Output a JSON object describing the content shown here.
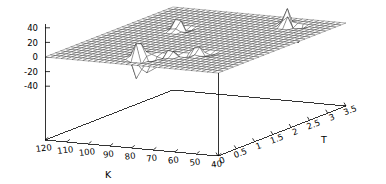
{
  "chart_data": {
    "type": "surface",
    "title": "",
    "xlabel": "K",
    "ylabel": "T",
    "zlabel": "",
    "grid": true,
    "legend": false,
    "projection": "3d-wireframe",
    "background": "#ffffff",
    "line_color": "#000000",
    "axes": {
      "x": {
        "name": "K",
        "ticks": [
          120,
          110,
          100,
          90,
          80,
          70,
          60,
          50,
          40
        ],
        "tick_labels": [
          "120",
          "110",
          "100",
          "90",
          "80",
          "70",
          "60",
          "50",
          "40"
        ],
        "range": [
          120,
          40
        ],
        "direction": "descending-left-to-right"
      },
      "y": {
        "name": "T",
        "ticks": [
          0,
          0.5,
          1,
          1.5,
          2,
          2.5,
          3,
          3.5
        ],
        "tick_labels": [
          "0",
          "0.5",
          "1",
          "1.5",
          "2",
          "2.5",
          "3",
          "3.5"
        ],
        "range": [
          0,
          3.5
        ],
        "direction": "ascending-left-to-right"
      },
      "z": {
        "name": "",
        "ticks": [
          40,
          20,
          0,
          -20,
          -40
        ],
        "tick_labels": [
          "40",
          "20",
          "0",
          "-20",
          "-40"
        ],
        "range": [
          -50,
          50
        ]
      }
    },
    "surface": {
      "description": "Near-flat zero surface over the K-T plane with localized spikes",
      "baseline": 0,
      "nx": 33,
      "ny": 26,
      "spikes": [
        {
          "k": 82,
          "t": 0.35,
          "z": -62,
          "label": "large-negative-spike"
        },
        {
          "k": 84,
          "t": 0.45,
          "z": 34,
          "label": "positive-spike-a"
        },
        {
          "k": 80,
          "t": 0.5,
          "z": -26,
          "label": "negative-spike-b"
        },
        {
          "k": 86,
          "t": 0.6,
          "z": 22,
          "label": "positive-spike-c"
        },
        {
          "k": 78,
          "t": 0.62,
          "z": -18,
          "label": "negative-spike-d"
        },
        {
          "k": 74,
          "t": 0.75,
          "z": 16,
          "label": "ripple-a"
        },
        {
          "k": 70,
          "t": 0.85,
          "z": -12,
          "label": "ripple-b"
        },
        {
          "k": 66,
          "t": 0.95,
          "z": 14,
          "label": "ripple-c"
        },
        {
          "k": 62,
          "t": 1.05,
          "z": -9,
          "label": "ripple-d"
        },
        {
          "k": 96,
          "t": 2.2,
          "z": 30,
          "label": "positive-spike-mid"
        },
        {
          "k": 94,
          "t": 2.3,
          "z": -14,
          "label": "negative-spike-mid"
        },
        {
          "k": 58,
          "t": 3.0,
          "z": 34,
          "label": "positive-spike-right"
        },
        {
          "k": 56,
          "t": 3.05,
          "z": -36,
          "label": "negative-spike-right"
        },
        {
          "k": 60,
          "t": 3.1,
          "z": 20,
          "label": "positive-spike-right-b"
        }
      ]
    }
  },
  "labels": {
    "x_axis_name": "K",
    "y_axis_name": "T",
    "z_ticks": [
      "40",
      "20",
      "0",
      "-20",
      "-40"
    ],
    "x_ticks": [
      "120",
      "110",
      "100",
      "90",
      "80",
      "70",
      "60",
      "50",
      "40"
    ],
    "y_ticks": [
      "0",
      "0.5",
      "1",
      "1.5",
      "2",
      "2.5",
      "3",
      "3.5"
    ]
  }
}
